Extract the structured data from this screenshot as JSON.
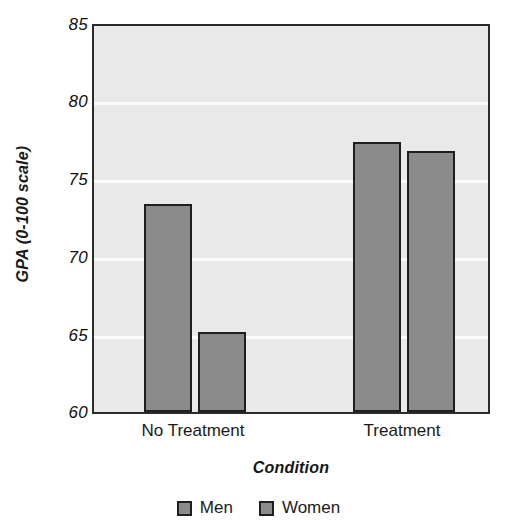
{
  "chart_data": {
    "type": "bar",
    "title": "",
    "xlabel": "Condition",
    "ylabel": "GPA (0-100 scale)",
    "categories": [
      "No Treatment",
      "Treatment"
    ],
    "series": [
      {
        "name": "Men",
        "values": [
          73.5,
          77.5
        ],
        "color": "#8b8b8b"
      },
      {
        "name": "Women",
        "values": [
          65.2,
          76.9
        ],
        "color": "#8b8b8b"
      }
    ],
    "ylim": [
      60,
      85
    ],
    "yticks": [
      60,
      65,
      70,
      75,
      80,
      85
    ],
    "ytick_labels": [
      "60",
      "65",
      "70",
      "75",
      "80",
      "85"
    ],
    "grid": true,
    "grid_color": "#fbfbfb",
    "legend_position": "bottom",
    "plot_background": "#e9e9e9",
    "axis_color": "#2b2b2b",
    "bar_edge_color": "#1f1f1f"
  },
  "axes": {
    "y_title": "GPA (0-100 scale)",
    "x_title": "Condition",
    "y_tick_labels": [
      "85",
      "80",
      "75",
      "70",
      "65",
      "60"
    ],
    "x_tick_labels": [
      "No Treatment",
      "Treatment"
    ]
  },
  "legend": {
    "items": [
      {
        "label": "Men",
        "color": "#8b8b8b"
      },
      {
        "label": "Women",
        "color": "#8b8b8b"
      }
    ]
  }
}
